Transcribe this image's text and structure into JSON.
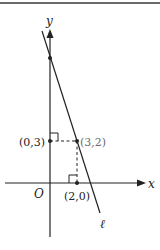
{
  "diagram": {
    "axes": {
      "x_label": "x",
      "y_label": "y",
      "origin_label": "O"
    },
    "line": {
      "label": "ℓ"
    },
    "points": [
      {
        "label": "(0,3)"
      },
      {
        "label": "(3,2)"
      },
      {
        "label": "(2,0)"
      }
    ],
    "colors": {
      "ink": "#222222",
      "faint": "#6a6a6a",
      "rule": "#6b6b6b"
    }
  }
}
